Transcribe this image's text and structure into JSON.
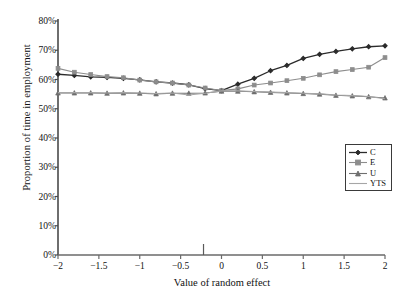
{
  "chart_data": {
    "type": "line",
    "title": "",
    "xlabel": "Value of random effect",
    "ylabel": "Proportion of time in employment",
    "xlim": [
      -2,
      2
    ],
    "ylim": [
      0,
      0.8
    ],
    "grid": false,
    "legend_position": "right-middle",
    "xticklabels": [
      "−2",
      "−1.5",
      "−1",
      "−0.5",
      "0",
      "0.5",
      "1",
      "1.5",
      "2"
    ],
    "xtickvalues": [
      -2,
      -1.5,
      -1,
      -0.5,
      0,
      0.5,
      1,
      1.5,
      2
    ],
    "yticklabels": [
      "0%",
      "10%",
      "20%",
      "30%",
      "40%",
      "50%",
      "60%",
      "70%",
      "80%"
    ],
    "ytickvalues": [
      0,
      10,
      20,
      30,
      40,
      50,
      60,
      70,
      80
    ],
    "x": [
      -2,
      -1.8,
      -1.6,
      -1.4,
      -1.2,
      -1,
      -0.8,
      -0.6,
      -0.4,
      -0.2,
      0,
      0.2,
      0.4,
      0.6,
      0.8,
      1,
      1.2,
      1.4,
      1.6,
      1.8,
      2
    ],
    "annotation_tick_x": -0.22,
    "series": [
      {
        "name": "C",
        "color": "#2b2b2b",
        "marker": "diamond",
        "values": [
          61.8,
          61.4,
          60.9,
          60.7,
          60.4,
          59.9,
          59.2,
          58.8,
          58.2,
          56.9,
          56.2,
          58.4,
          60.4,
          63.0,
          64.8,
          67.2,
          68.6,
          69.6,
          70.5,
          71.2,
          71.5
        ]
      },
      {
        "name": "E",
        "color": "#8d8d8d",
        "marker": "square",
        "values": [
          63.8,
          62.5,
          61.7,
          61.0,
          60.6,
          59.8,
          59.2,
          58.8,
          58.1,
          57.1,
          56.2,
          56.8,
          58.1,
          58.8,
          59.6,
          60.4,
          61.6,
          62.7,
          63.4,
          64.2,
          67.5
        ]
      },
      {
        "name": "U",
        "color": "#6f6f6f",
        "marker": "triangle",
        "values": [
          55.4,
          55.4,
          55.4,
          55.3,
          55.4,
          55.3,
          55.1,
          55.3,
          55.3,
          55.4,
          56.0,
          56.0,
          55.8,
          55.6,
          55.4,
          55.2,
          55.0,
          54.6,
          54.4,
          54.1,
          53.7
        ]
      },
      {
        "name": "YTS",
        "color": "#a6a6a6",
        "marker": "none",
        "values": [
          55.5,
          55.5,
          55.5,
          55.4,
          55.5,
          55.4,
          55.2,
          55.4,
          54.7,
          55.3,
          56.1,
          56.1,
          55.9,
          55.7,
          55.5,
          55.3,
          55.1,
          54.7,
          54.5,
          54.2,
          53.4
        ]
      }
    ]
  },
  "legend": {
    "items": [
      {
        "label": "C"
      },
      {
        "label": "E"
      },
      {
        "label": "U"
      },
      {
        "label": "YTS"
      }
    ]
  }
}
